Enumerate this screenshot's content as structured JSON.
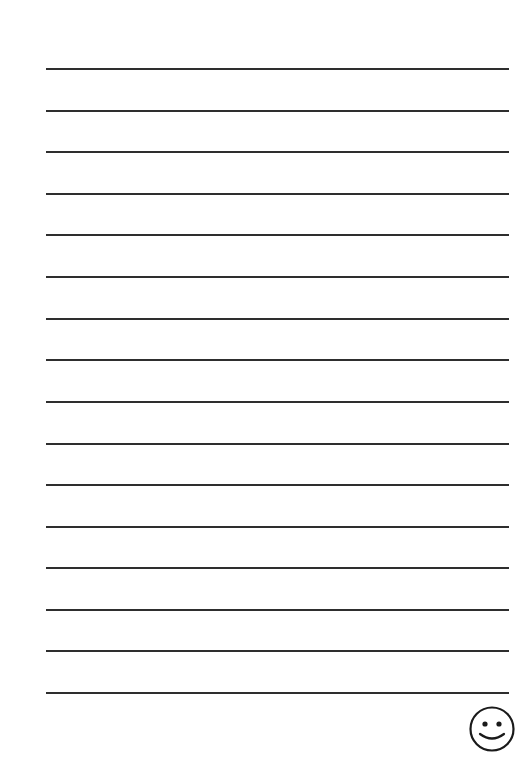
{
  "page": {
    "type": "lined-writing-paper",
    "background_color": "#ffffff",
    "line_color": "#2e2e2e",
    "line_count": 16,
    "line_positions_y": [
      69,
      111,
      152,
      194,
      235,
      277,
      319,
      360,
      402,
      444,
      485,
      527,
      568,
      610,
      651,
      693
    ],
    "line_left_x": 46,
    "line_right_x": 509,
    "line_thickness": 2
  },
  "decoration": {
    "icon": "smiley-face-icon",
    "position": "bottom-right"
  }
}
